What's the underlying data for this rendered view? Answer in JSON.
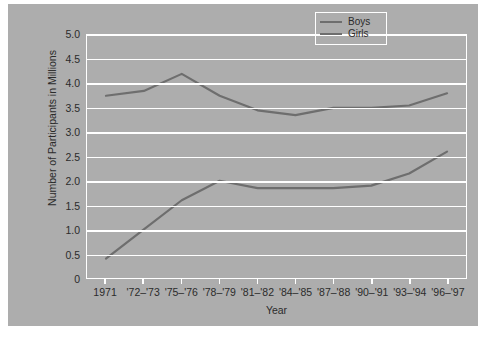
{
  "chart_data": {
    "type": "line",
    "title": "",
    "xlabel": "Year",
    "ylabel": "Number of Participants in Millions",
    "categories": [
      "1971",
      "'72–'73",
      "'75–'76",
      "'78–'79",
      "'81–'82",
      "'84–'85",
      "'87–'88",
      "'90–'91",
      "'93–'94",
      "'96–'97"
    ],
    "series": [
      {
        "name": "Boys",
        "values": [
          3.75,
          3.85,
          4.2,
          3.75,
          3.45,
          3.35,
          3.5,
          3.5,
          3.55,
          3.8
        ]
      },
      {
        "name": "Girls",
        "values": [
          0.4,
          1.0,
          1.6,
          2.0,
          1.85,
          1.85,
          1.85,
          1.9,
          2.15,
          2.6
        ]
      }
    ],
    "ylim": [
      0,
      5.0
    ],
    "yticks": [
      "0",
      "0.5",
      "1.0",
      "1.5",
      "2.0",
      "2.5",
      "3.0",
      "3.5",
      "4.0",
      "4.5",
      "5.0"
    ],
    "ytick_values": [
      0,
      0.5,
      1.0,
      1.5,
      2.0,
      2.5,
      3.0,
      3.5,
      4.0,
      4.5,
      5.0
    ],
    "grid": true,
    "legend_position": "top-right",
    "colors": {
      "line": "#6e6e6e",
      "panel": "#adadad",
      "grid": "#ffffff",
      "text": "#2b2b2b",
      "figure": "#ffffff"
    }
  },
  "legend": {
    "items": [
      {
        "label": "Boys"
      },
      {
        "label": "Girls"
      }
    ]
  }
}
